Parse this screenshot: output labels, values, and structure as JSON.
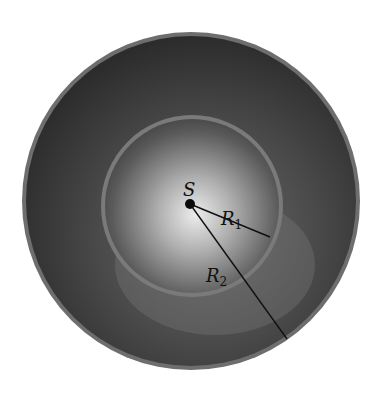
{
  "diagram": {
    "type": "concentric-spherical-shells",
    "source_label": "S",
    "radius_labels": [
      {
        "main": "R",
        "sub": "1"
      },
      {
        "main": "R",
        "sub": "2"
      }
    ],
    "colors": {
      "background": "#ffffff",
      "outer_rim": "#6e6e6e",
      "outer_shell_dark": "#2e2e2e",
      "inner_rim": "#7a7a7a",
      "inner_center_light": "#e8e8e8",
      "line": "#111111"
    }
  }
}
